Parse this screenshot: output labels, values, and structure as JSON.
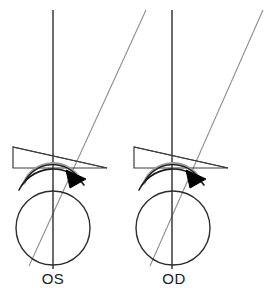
{
  "figure": {
    "background_color": "#ffffff",
    "width": 266,
    "height": 295
  },
  "colors": {
    "axis_line": "#3a3a3a",
    "oblique_line": "#8e8e8e",
    "globe_outline": "#2b2b2b",
    "prism_outline": "#3d3d3d",
    "arc_outer": "#1a1a1a",
    "arc_inner": "#9a9a9a",
    "arrow_fill": "#000000",
    "label_text": "#1a1a1a"
  },
  "diagrams": [
    {
      "id": "os",
      "label": "OS",
      "label_x": 53,
      "label_y": 283,
      "globe": {
        "cx": 53,
        "cy": 228,
        "r": 37
      },
      "vertical_axis": {
        "x1": 53,
        "y1": 10,
        "x2": 53,
        "y2": 269
      },
      "oblique_axis": {
        "x1": 146,
        "y1": 10,
        "x2": 29,
        "y2": 266
      },
      "prism": {
        "points": "13,147 13,168 107,168 13,147",
        "left_top": [
          13,
          147
        ],
        "left_bottom": [
          13,
          168
        ],
        "apex": [
          107,
          168
        ]
      },
      "arc_outer": {
        "path": "M 20,188 A 37 37 0 0 1 86,185"
      },
      "arc_inner": {
        "path": "M 24,182 A 33 33 0 0 1 82,180"
      },
      "arrowhead": {
        "points": "66,171 85,178 71,187",
        "rotation": 0
      }
    },
    {
      "id": "od",
      "label": "OD",
      "label_x": 174,
      "label_y": 283,
      "globe": {
        "cx": 174,
        "cy": 228,
        "r": 37
      },
      "vertical_axis": {
        "x1": 172,
        "y1": 10,
        "x2": 172,
        "y2": 269
      },
      "oblique_axis": {
        "x1": 262,
        "y1": 10,
        "x2": 150,
        "y2": 266
      },
      "prism": {
        "points": "134,147 134,168 228,168 134,147",
        "left_top": [
          134,
          147
        ],
        "left_bottom": [
          134,
          168
        ],
        "apex": [
          228,
          168
        ]
      },
      "arc_outer": {
        "path": "M 141,188 A 37 37 0 0 1 207,185"
      },
      "arc_inner": {
        "path": "M 145,182 A 33 33 0 0 1 203,180"
      },
      "arrowhead": {
        "points": "187,171 206,178 192,187",
        "rotation": 0
      }
    }
  ],
  "icons": {
    "rotation_arrow": "curved-arrow-icon",
    "prism": "prism-wedge-icon",
    "globe": "eye-globe-icon"
  }
}
